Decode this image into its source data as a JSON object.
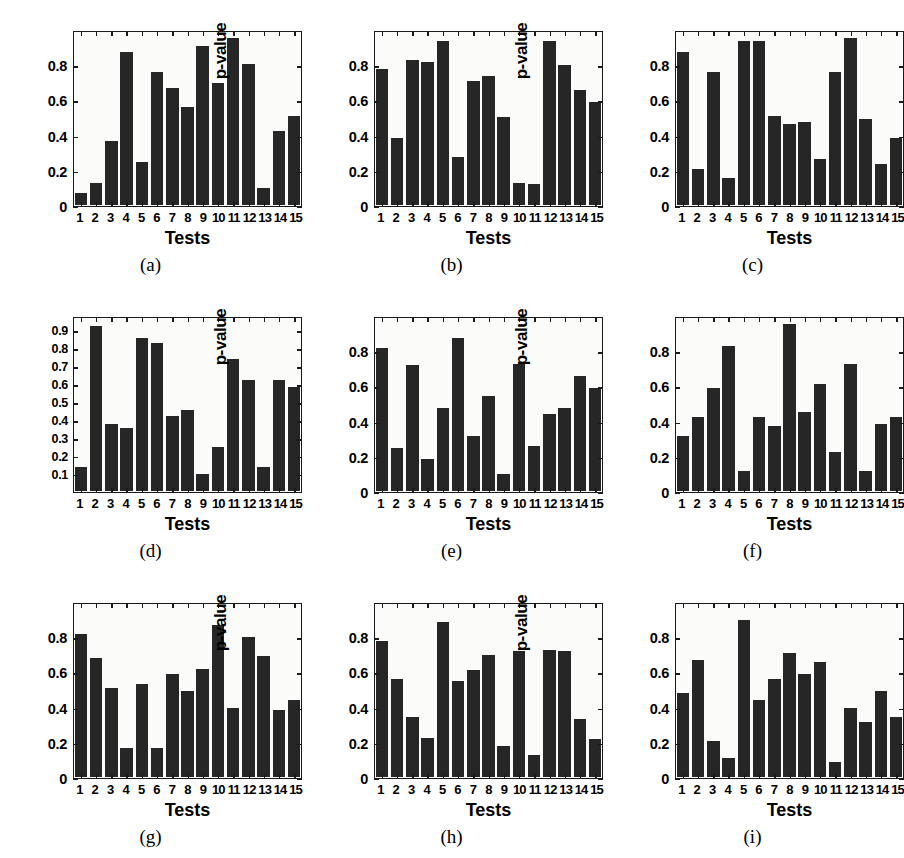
{
  "figure": {
    "panel_count": 9,
    "bar_color": "#262626",
    "axis_color": "#1a1a1a",
    "background_color": "#ffffff"
  },
  "chart_data": [
    {
      "type": "bar",
      "caption": "(a)",
      "title": "",
      "xlabel": "Tests",
      "ylabel": "p-value",
      "categories": [
        "1",
        "2",
        "3",
        "4",
        "5",
        "6",
        "7",
        "8",
        "9",
        "10",
        "11",
        "12",
        "13",
        "14",
        "15"
      ],
      "values": [
        0.07,
        0.13,
        0.37,
        0.89,
        0.25,
        0.77,
        0.68,
        0.57,
        0.92,
        0.71,
        0.97,
        0.82,
        0.1,
        0.43,
        0.52
      ],
      "yticks": [
        0,
        0.2,
        0.4,
        0.6,
        0.8
      ],
      "ytick_labels": [
        "0",
        "0.2",
        "0.4",
        "0.6",
        "0.8"
      ],
      "ylim": [
        0,
        1.0
      ],
      "grid": false,
      "legend": "none"
    },
    {
      "type": "bar",
      "caption": "(b)",
      "title": "",
      "xlabel": "Tests",
      "ylabel": "p-value",
      "categories": [
        "1",
        "2",
        "3",
        "4",
        "5",
        "6",
        "7",
        "8",
        "9",
        "10",
        "11",
        "12",
        "13",
        "14",
        "15"
      ],
      "values": [
        0.79,
        0.39,
        0.84,
        0.83,
        0.95,
        0.28,
        0.72,
        0.75,
        0.51,
        0.13,
        0.125,
        0.95,
        0.81,
        0.67,
        0.6
      ],
      "yticks": [
        0,
        0.2,
        0.4,
        0.6,
        0.8
      ],
      "ytick_labels": [
        "0",
        "0.2",
        "0.4",
        "0.6",
        "0.8"
      ],
      "ylim": [
        0,
        1.0
      ],
      "grid": false,
      "legend": "none"
    },
    {
      "type": "bar",
      "caption": "(c)",
      "title": "",
      "xlabel": "Tests",
      "ylabel": "p-value",
      "categories": [
        "1",
        "2",
        "3",
        "4",
        "5",
        "6",
        "7",
        "8",
        "9",
        "10",
        "11",
        "12",
        "13",
        "14",
        "15"
      ],
      "values": [
        0.89,
        0.21,
        0.77,
        0.16,
        0.95,
        0.95,
        0.52,
        0.47,
        0.48,
        0.27,
        0.77,
        0.97,
        0.5,
        0.24,
        0.39
      ],
      "yticks": [
        0,
        0.2,
        0.4,
        0.6,
        0.8
      ],
      "ytick_labels": [
        "0",
        "0.2",
        "0.4",
        "0.6",
        "0.8"
      ],
      "ylim": [
        0,
        1.0
      ],
      "grid": false,
      "legend": "none"
    },
    {
      "type": "bar",
      "caption": "(d)",
      "title": "",
      "xlabel": "Tests",
      "ylabel": "p-value",
      "categories": [
        "1",
        "2",
        "3",
        "4",
        "5",
        "6",
        "7",
        "8",
        "9",
        "10",
        "11",
        "12",
        "13",
        "14",
        "15"
      ],
      "values": [
        0.14,
        0.94,
        0.38,
        0.36,
        0.87,
        0.84,
        0.43,
        0.46,
        0.1,
        0.25,
        0.75,
        0.63,
        0.14,
        0.63,
        0.59
      ],
      "yticks": [
        0.1,
        0.2,
        0.3,
        0.4,
        0.5,
        0.6,
        0.7,
        0.8,
        0.9
      ],
      "ytick_labels": [
        "0.1",
        "0.2",
        "0.3",
        "0.4",
        "0.5",
        "0.6",
        "0.7",
        "0.8",
        "0.9"
      ],
      "ylim": [
        0,
        0.98
      ],
      "grid": false,
      "legend": "none"
    },
    {
      "type": "bar",
      "caption": "(e)",
      "title": "",
      "xlabel": "Tests",
      "ylabel": "p-value",
      "categories": [
        "1",
        "2",
        "3",
        "4",
        "5",
        "6",
        "7",
        "8",
        "9",
        "10",
        "11",
        "12",
        "13",
        "14",
        "15"
      ],
      "values": [
        0.83,
        0.25,
        0.73,
        0.19,
        0.48,
        0.89,
        0.32,
        0.55,
        0.1,
        0.74,
        0.26,
        0.45,
        0.48,
        0.67,
        0.6
      ],
      "yticks": [
        0,
        0.2,
        0.4,
        0.6,
        0.8
      ],
      "ytick_labels": [
        "0",
        "0.2",
        "0.4",
        "0.6",
        "0.8"
      ],
      "ylim": [
        0,
        1.0
      ],
      "grid": false,
      "legend": "none"
    },
    {
      "type": "bar",
      "caption": "(f)",
      "title": "",
      "xlabel": "Tests",
      "ylabel": "p-value",
      "categories": [
        "1",
        "2",
        "3",
        "4",
        "5",
        "6",
        "7",
        "8",
        "9",
        "10",
        "11",
        "12",
        "13",
        "14",
        "15"
      ],
      "values": [
        0.32,
        0.43,
        0.6,
        0.84,
        0.12,
        0.43,
        0.38,
        0.97,
        0.46,
        0.62,
        0.23,
        0.74,
        0.12,
        0.39,
        0.43
      ],
      "yticks": [
        0,
        0.2,
        0.4,
        0.6,
        0.8
      ],
      "ytick_labels": [
        "0",
        "0.2",
        "0.4",
        "0.6",
        "0.8"
      ],
      "ylim": [
        0,
        1.0
      ],
      "grid": false,
      "legend": "none"
    },
    {
      "type": "bar",
      "caption": "(g)",
      "title": "",
      "xlabel": "Tests",
      "ylabel": "p-value",
      "categories": [
        "1",
        "2",
        "3",
        "4",
        "5",
        "6",
        "7",
        "8",
        "9",
        "10",
        "11",
        "12",
        "13",
        "14",
        "15"
      ],
      "values": [
        0.83,
        0.69,
        0.52,
        0.17,
        0.54,
        0.17,
        0.6,
        0.5,
        0.63,
        0.88,
        0.4,
        0.81,
        0.7,
        0.39,
        0.45
      ],
      "yticks": [
        0,
        0.2,
        0.4,
        0.6,
        0.8
      ],
      "ytick_labels": [
        "0",
        "0.2",
        "0.4",
        "0.6",
        "0.8"
      ],
      "ylim": [
        0,
        1.0
      ],
      "grid": false,
      "legend": "none"
    },
    {
      "type": "bar",
      "caption": "(h)",
      "title": "",
      "xlabel": "Tests",
      "ylabel": "p-value",
      "categories": [
        "1",
        "2",
        "3",
        "4",
        "5",
        "6",
        "7",
        "8",
        "9",
        "10",
        "11",
        "12",
        "13",
        "14",
        "15"
      ],
      "values": [
        0.79,
        0.57,
        0.35,
        0.23,
        0.9,
        0.56,
        0.62,
        0.71,
        0.18,
        0.73,
        0.13,
        0.74,
        0.73,
        0.34,
        0.22
      ],
      "yticks": [
        0,
        0.2,
        0.4,
        0.6,
        0.8
      ],
      "ytick_labels": [
        "0",
        "0.2",
        "0.4",
        "0.6",
        "0.8"
      ],
      "ylim": [
        0,
        1.0
      ],
      "grid": false,
      "legend": "none"
    },
    {
      "type": "bar",
      "caption": "(i)",
      "title": "",
      "xlabel": "Tests",
      "ylabel": "p-value",
      "categories": [
        "1",
        "2",
        "3",
        "4",
        "5",
        "6",
        "7",
        "8",
        "9",
        "10",
        "11",
        "12",
        "13",
        "14",
        "15"
      ],
      "values": [
        0.49,
        0.68,
        0.21,
        0.11,
        0.91,
        0.45,
        0.57,
        0.72,
        0.6,
        0.67,
        0.09,
        0.4,
        0.32,
        0.5,
        0.35
      ],
      "yticks": [
        0,
        0.2,
        0.4,
        0.6,
        0.8
      ],
      "ytick_labels": [
        "0",
        "0.2",
        "0.4",
        "0.6",
        "0.8"
      ],
      "ylim": [
        0,
        1.0
      ],
      "grid": false,
      "legend": "none"
    }
  ]
}
